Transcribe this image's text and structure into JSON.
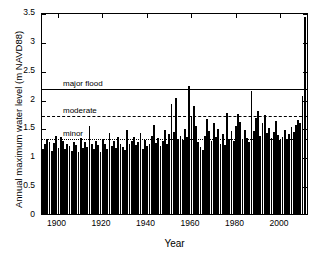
{
  "chart_data": {
    "type": "bar",
    "title": "",
    "xlabel": "Year",
    "ylabel": "Annual maximum water level (m NAVD88)",
    "xlim": [
      1893,
      2013
    ],
    "ylim": [
      0,
      3.5
    ],
    "ytick_labels": [
      "0",
      "0.5",
      "1",
      "1.5",
      "2",
      "2.5",
      "3",
      "3.5"
    ],
    "ytick_values": [
      0,
      0.5,
      1,
      1.5,
      2,
      2.5,
      3,
      3.5
    ],
    "xtick_labels": [
      "1900",
      "1920",
      "1940",
      "1960",
      "1980",
      "2000"
    ],
    "xtick_values": [
      1900,
      1920,
      1940,
      1960,
      1980,
      2000
    ],
    "grid": false,
    "legend": "none",
    "bar_color": "#000000",
    "annotations": [
      {
        "name": "major flood",
        "label": "major flood",
        "value": 2.2,
        "style": "solid"
      },
      {
        "name": "moderate",
        "label": "moderate",
        "value": 1.73,
        "style": "dashed"
      },
      {
        "name": "minor",
        "label": "minor",
        "value": 1.34,
        "style": "dotted"
      }
    ],
    "x": [
      1894,
      1895,
      1896,
      1897,
      1898,
      1899,
      1900,
      1901,
      1902,
      1903,
      1904,
      1905,
      1906,
      1907,
      1908,
      1909,
      1910,
      1911,
      1912,
      1913,
      1914,
      1915,
      1916,
      1917,
      1918,
      1919,
      1920,
      1921,
      1922,
      1923,
      1924,
      1925,
      1926,
      1927,
      1928,
      1929,
      1930,
      1931,
      1932,
      1933,
      1934,
      1935,
      1936,
      1937,
      1938,
      1939,
      1940,
      1941,
      1942,
      1943,
      1944,
      1945,
      1946,
      1947,
      1948,
      1949,
      1950,
      1951,
      1952,
      1953,
      1954,
      1955,
      1956,
      1957,
      1958,
      1959,
      1960,
      1961,
      1962,
      1963,
      1964,
      1965,
      1966,
      1967,
      1968,
      1969,
      1970,
      1971,
      1972,
      1973,
      1974,
      1975,
      1976,
      1977,
      1978,
      1979,
      1980,
      1981,
      1982,
      1983,
      1984,
      1985,
      1986,
      1987,
      1988,
      1989,
      1990,
      1991,
      1992,
      1993,
      1994,
      1995,
      1996,
      1997,
      1998,
      1999,
      2000,
      2001,
      2002,
      2003,
      2004,
      2005,
      2006,
      2007,
      2008,
      2009,
      2010,
      2011,
      2012
    ],
    "values": [
      1.12,
      1.21,
      1.3,
      1.25,
      1.09,
      1.23,
      1.36,
      1.15,
      1.33,
      1.27,
      1.13,
      1.22,
      1.18,
      1.1,
      1.25,
      1.2,
      1.08,
      1.31,
      1.15,
      1.24,
      1.16,
      1.53,
      1.21,
      1.13,
      1.27,
      1.19,
      1.08,
      1.3,
      1.22,
      1.12,
      1.41,
      1.18,
      1.26,
      1.14,
      1.33,
      1.22,
      1.16,
      1.11,
      1.46,
      1.21,
      1.27,
      1.34,
      1.19,
      1.24,
      1.4,
      1.13,
      1.29,
      1.17,
      1.22,
      1.35,
      1.55,
      1.23,
      1.31,
      1.18,
      1.26,
      1.45,
      1.21,
      1.38,
      1.9,
      1.42,
      2.01,
      1.3,
      1.35,
      1.28,
      1.47,
      1.33,
      2.22,
      1.7,
      1.88,
      1.52,
      1.24,
      1.16,
      1.11,
      1.35,
      1.65,
      1.43,
      1.27,
      1.57,
      1.34,
      1.48,
      1.22,
      1.39,
      1.19,
      1.75,
      1.3,
      1.43,
      1.27,
      1.52,
      1.74,
      1.6,
      1.29,
      1.46,
      1.31,
      1.24,
      2.13,
      1.44,
      1.66,
      1.78,
      1.35,
      1.58,
      1.72,
      1.4,
      1.49,
      1.31,
      1.42,
      1.62,
      1.37,
      1.28,
      1.34,
      1.45,
      1.3,
      1.39,
      1.51,
      1.42,
      1.55,
      1.63,
      1.58,
      2.04,
      3.42
    ]
  }
}
